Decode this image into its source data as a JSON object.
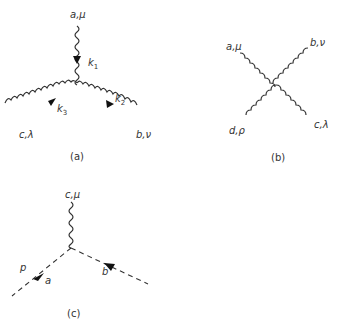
{
  "diagrams": [
    {
      "id": "a",
      "caption": "(a)",
      "description": "three-gluon vertex",
      "labels": {
        "top": "a,μ",
        "left": "c,λ",
        "right": "b,ν"
      },
      "momenta": {
        "k1": "k",
        "k1_sub": "1",
        "k2": "k",
        "k2_sub": "2",
        "k3": "k",
        "k3_sub": "3"
      }
    },
    {
      "id": "b",
      "caption": "(b)",
      "description": "four-gluon vertex",
      "labels": {
        "top_left": "a,μ",
        "top_right": "b,ν",
        "bottom_left": "d,ρ",
        "bottom_right": "c,λ"
      }
    },
    {
      "id": "c",
      "caption": "(c)",
      "description": "ghost-gluon vertex",
      "labels": {
        "top": "c,μ",
        "p": "p",
        "left": "a",
        "right": "b"
      }
    }
  ]
}
